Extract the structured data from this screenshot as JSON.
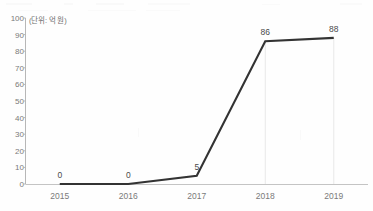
{
  "chart_data": {
    "type": "line",
    "title": "",
    "subtitle": "",
    "unit_note": "(단위: 억 원)",
    "xlabel": "",
    "ylabel": "",
    "categories": [
      "2015",
      "2016",
      "2017",
      "2018",
      "2019"
    ],
    "values": [
      0,
      0,
      5,
      86,
      88
    ],
    "point_labels": [
      "0",
      "0",
      "5",
      "86",
      "88"
    ],
    "series": [
      {
        "name": "",
        "values": [
          0,
          0,
          5,
          86,
          88
        ],
        "color": "#333333"
      }
    ],
    "ylim": [
      0,
      100
    ],
    "ytick_values": [
      0,
      10,
      20,
      30,
      40,
      50,
      60,
      70,
      80,
      90,
      100
    ],
    "ytick_labels": [
      "0",
      "10",
      "20",
      "30",
      "40",
      "50",
      "60",
      "70",
      "80",
      "90",
      "100"
    ],
    "xtick_labels": [
      "2015",
      "2016",
      "2017",
      "2018",
      "2019"
    ],
    "grid": "vertical-partial",
    "gridline_categories": [
      "2018",
      "2019"
    ],
    "legend": "none",
    "legend_position": "none"
  },
  "colors": {
    "line": "#333333",
    "axis": "#b7b7b7",
    "gridline": "#e8e8e8",
    "tick_text": "#7a7a7a",
    "label_text": "#4a4a4a",
    "background": "#fefefe"
  }
}
